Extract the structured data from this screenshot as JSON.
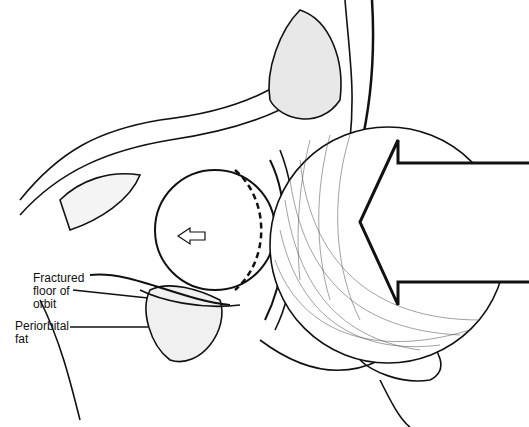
{
  "figure": {
    "labels": [
      {
        "id": "fractured-floor",
        "lines": [
          "Fractured",
          "floor of",
          "orbit"
        ]
      },
      {
        "id": "periorbital-fat",
        "lines": [
          "Periorbital",
          "fat"
        ]
      }
    ],
    "colors": {
      "ink": "#111111",
      "background": "#ffffff"
    }
  }
}
